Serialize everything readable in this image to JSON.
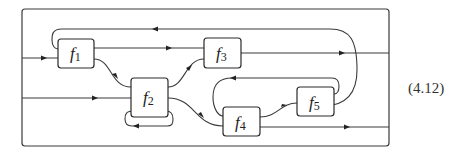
{
  "diagram": {
    "type": "string-diagram",
    "equation_number": "(4.12)",
    "boxes": [
      {
        "id": "f1",
        "name": "f",
        "subscript": "1"
      },
      {
        "id": "f2",
        "name": "f",
        "subscript": "2"
      },
      {
        "id": "f3",
        "name": "f",
        "subscript": "3"
      },
      {
        "id": "f4",
        "name": "f",
        "subscript": "4"
      },
      {
        "id": "f5",
        "name": "f",
        "subscript": "5"
      }
    ],
    "colors": {
      "stroke": "#3a3a3a",
      "background": "#ffffff"
    }
  }
}
